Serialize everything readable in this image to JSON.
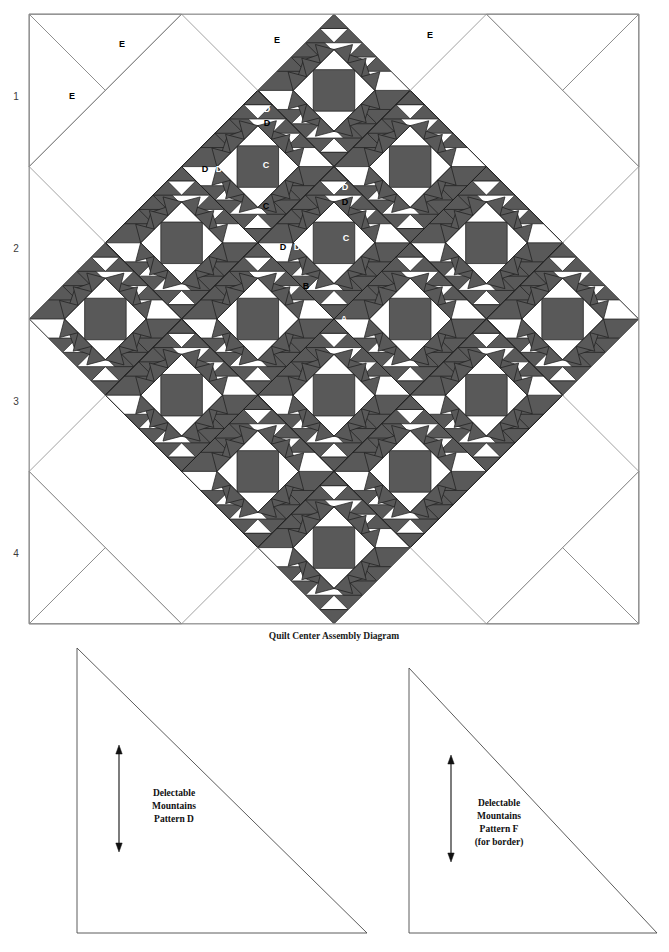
{
  "figure": {
    "caption": "Quilt Center Assembly Diagram",
    "colors": {
      "dark_fabric": "#595959",
      "light_fabric": "#ffffff",
      "outline": "#1f1f1f",
      "setting_outline": "#8a8a8a",
      "row_number": "#3b3b3b"
    }
  },
  "quilt": {
    "row_numbers": [
      "1",
      "2",
      "3",
      "4"
    ],
    "piece_labels": [
      {
        "id": "A",
        "text": "A",
        "x": 344,
        "y": 322,
        "on": "dark",
        "note": "center square, set on point"
      },
      {
        "id": "B",
        "text": "B",
        "x": 306,
        "y": 289,
        "on": "light",
        "note": "corner triangle around center square"
      },
      {
        "id": "C1",
        "text": "C",
        "x": 266,
        "y": 168,
        "on": "dark",
        "note": "large mountain triangle"
      },
      {
        "id": "C2",
        "text": "C",
        "x": 266,
        "y": 209,
        "on": "light",
        "note": "large background triangle"
      },
      {
        "id": "C3",
        "text": "C",
        "x": 346,
        "y": 241,
        "on": "dark",
        "note": "large mountain triangle"
      },
      {
        "id": "D1",
        "text": "D",
        "x": 267,
        "y": 112,
        "on": "dark",
        "note": "sawtooth triangle"
      },
      {
        "id": "D2",
        "text": "D",
        "x": 267,
        "y": 126,
        "on": "light",
        "note": "sawtooth triangle"
      },
      {
        "id": "D3",
        "text": "D",
        "x": 205,
        "y": 172,
        "on": "light",
        "note": "sawtooth triangle"
      },
      {
        "id": "D4",
        "text": "D",
        "x": 219,
        "y": 172,
        "on": "dark",
        "note": "sawtooth triangle"
      },
      {
        "id": "D5",
        "text": "D",
        "x": 345,
        "y": 190,
        "on": "dark",
        "note": "sawtooth triangle"
      },
      {
        "id": "D6",
        "text": "D",
        "x": 345,
        "y": 205,
        "on": "light",
        "note": "sawtooth triangle"
      },
      {
        "id": "D7",
        "text": "D",
        "x": 283,
        "y": 250,
        "on": "light",
        "note": "sawtooth triangle"
      },
      {
        "id": "D8",
        "text": "D",
        "x": 297,
        "y": 250,
        "on": "dark",
        "note": "sawtooth triangle"
      },
      {
        "id": "E1",
        "text": "E",
        "x": 122,
        "y": 47,
        "on": "light",
        "note": "setting triangle"
      },
      {
        "id": "E2",
        "text": "E",
        "x": 72,
        "y": 99,
        "on": "light",
        "note": "corner setting triangle"
      },
      {
        "id": "E3",
        "text": "E",
        "x": 277,
        "y": 43,
        "on": "light",
        "note": "setting triangle"
      },
      {
        "id": "E4",
        "text": "E",
        "x": 430,
        "y": 38,
        "on": "light",
        "note": "setting triangle"
      }
    ]
  },
  "templates": [
    {
      "id": "pattern-d",
      "lines": [
        "Delectable",
        "Mountains",
        "Pattern D"
      ],
      "grainline": "vertical double-headed arrow",
      "apex": {
        "x": 77,
        "y": 648
      },
      "bottom_right": {
        "x": 367,
        "y": 933
      }
    },
    {
      "id": "pattern-f",
      "lines": [
        "Delectable",
        "Mountains",
        "Pattern F",
        "(for border)"
      ],
      "grainline": "vertical double-headed arrow",
      "apex": {
        "x": 409,
        "y": 668
      },
      "bottom_right": {
        "x": 657,
        "y": 933
      }
    }
  ]
}
